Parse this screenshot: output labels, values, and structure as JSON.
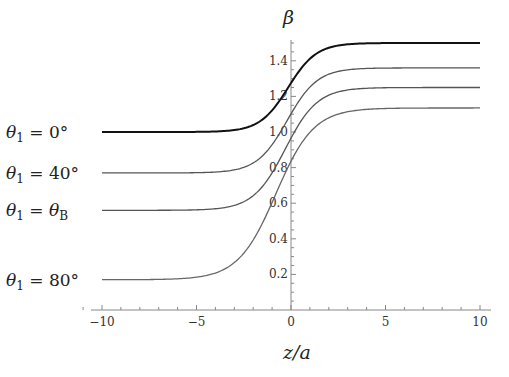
{
  "chart_data": {
    "type": "line",
    "title": "",
    "xlabel": "z/a",
    "ylabel": "β",
    "xlim": [
      -11.1,
      10
    ],
    "ylim": [
      0,
      1.52
    ],
    "grid": false,
    "legend_position": "left, inline labels beside each curve",
    "x_ticks": [
      -10,
      -5,
      0,
      5,
      10
    ],
    "x_tick_labels": [
      "−10",
      "−5",
      "0",
      "5",
      "10"
    ],
    "y_ticks": [
      0.2,
      0.4,
      0.6,
      0.8,
      1.0,
      1.2,
      1.4
    ],
    "y_tick_labels": [
      "0.2",
      "0.4",
      "0.6",
      "0.8",
      "1.0",
      "1.2",
      "1.4"
    ],
    "x": [
      -11,
      -10,
      -9,
      -8,
      -7,
      -6,
      -5,
      -4,
      -3,
      -2,
      -1,
      0,
      1,
      2,
      3,
      4,
      5,
      6,
      7,
      8,
      9,
      10
    ],
    "series": [
      {
        "name": "θ1 = 0°",
        "label_main": "θ",
        "label_sub": "1",
        "label_rhs": " = 0°",
        "color": "#111111",
        "width": 2.0,
        "params": {
          "beta_left": 1.0,
          "beta_right": 1.5,
          "z0": -0.15,
          "w": 1.5
        },
        "values": [
          1.0,
          1.0,
          1.0,
          1.0,
          1.0,
          1.0,
          1.0,
          1.004,
          1.014,
          1.042,
          1.111,
          1.275,
          1.409,
          1.469,
          1.49,
          1.497,
          1.499,
          1.5,
          1.5,
          1.5,
          1.5,
          1.5
        ]
      },
      {
        "name": "θ1 = 40°",
        "label_main": "θ",
        "label_sub": "1",
        "label_rhs": " = 40°",
        "color": "#555555",
        "width": 1.3,
        "params": {
          "beta_left": 0.77,
          "beta_right": 1.36,
          "z0": -0.2,
          "w": 1.6
        },
        "values": [
          0.77,
          0.77,
          0.77,
          0.771,
          0.772,
          0.774,
          0.78,
          0.793,
          0.822,
          0.885,
          0.988,
          1.102,
          1.224,
          1.3,
          1.338,
          1.353,
          1.358,
          1.359,
          1.36,
          1.36,
          1.36,
          1.36
        ]
      },
      {
        "name": "θ1 = θB",
        "label_main": "θ",
        "label_sub": "1",
        "label_rhs": " = θ",
        "label_rhs_sub": "B",
        "color": "#555555",
        "width": 1.3,
        "params": {
          "beta_left": 0.56,
          "beta_right": 1.25,
          "z0": -0.3,
          "w": 1.7
        },
        "values": [
          0.56,
          0.56,
          0.561,
          0.562,
          0.564,
          0.569,
          0.58,
          0.603,
          0.648,
          0.725,
          0.835,
          0.965,
          1.081,
          1.162,
          1.21,
          1.233,
          1.243,
          1.247,
          1.249,
          1.25,
          1.25,
          1.25
        ]
      },
      {
        "name": "θ1 = 80°",
        "label_main": "θ",
        "label_sub": "1",
        "label_rhs": " = 80°",
        "color": "#666666",
        "width": 1.3,
        "params": {
          "beta_left": 0.17,
          "beta_right": 1.135,
          "z0": -0.8,
          "w": 2.0
        },
        "values": [
          0.172,
          0.175,
          0.18,
          0.189,
          0.205,
          0.232,
          0.276,
          0.343,
          0.437,
          0.555,
          0.685,
          0.836,
          0.962,
          1.045,
          1.092,
          1.115,
          1.126,
          1.131,
          1.133,
          1.134,
          1.135,
          1.135
        ]
      }
    ]
  }
}
